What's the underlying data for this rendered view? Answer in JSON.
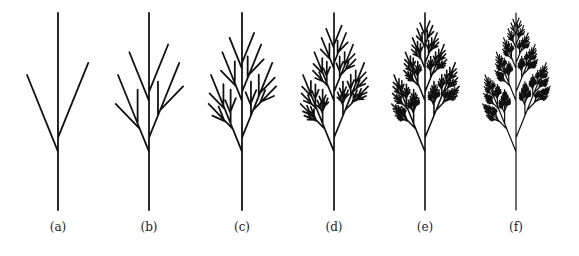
{
  "figure": {
    "stroke_color": "#111111",
    "background": "#ffffff",
    "trunk_base_y": 210,
    "trunk_top_y": 13,
    "branch_angle_deg": 22,
    "left_node_fraction": 0.296,
    "right_node_fraction": 0.367,
    "left_branch_scale": 0.42,
    "right_branch_scale": 0.41,
    "label_y": 228
  },
  "panels": [
    {
      "label": "(a)",
      "x": 58,
      "iterations": 1,
      "stroke_width": 1.8
    },
    {
      "label": "(b)",
      "x": 149,
      "iterations": 2,
      "stroke_width": 1.8
    },
    {
      "label": "(c)",
      "x": 242,
      "iterations": 3,
      "stroke_width": 1.8
    },
    {
      "label": "(d)",
      "x": 334,
      "iterations": 4,
      "stroke_width": 1.7
    },
    {
      "label": "(e)",
      "x": 425,
      "iterations": 5,
      "stroke_width": 1.6
    },
    {
      "label": "(f)",
      "x": 516,
      "iterations": 6,
      "stroke_width": 1.2
    }
  ]
}
